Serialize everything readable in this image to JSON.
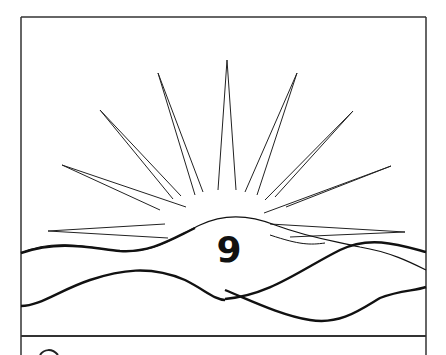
{
  "illustration": {
    "subject": "sunrise-over-hills",
    "number_label": "9",
    "colors": {
      "background": "#ffffff",
      "line": "#1a1a1a",
      "frame": "#333333"
    }
  }
}
